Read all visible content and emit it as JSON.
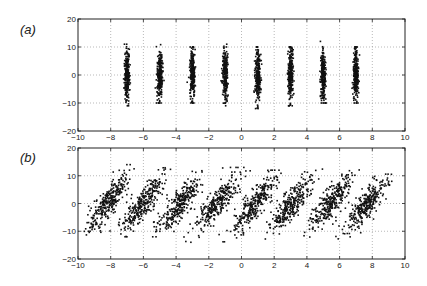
{
  "chart_data": [
    {
      "type": "scatter",
      "panel_label": "(a)",
      "title": "",
      "xlabel": "",
      "ylabel": "",
      "xlim": [
        -10,
        10
      ],
      "ylim": [
        -20,
        20
      ],
      "xticks": [
        -10,
        -8,
        -6,
        -4,
        -2,
        0,
        2,
        4,
        6,
        8,
        10
      ],
      "yticks": [
        -20,
        -10,
        0,
        10,
        20
      ],
      "grid": true,
      "legend": null,
      "clusters": [
        {
          "center_x": -7,
          "spread_x": 0.08,
          "shear": 0.0,
          "spread_y": 4.5,
          "y_range": [
            -11,
            11
          ]
        },
        {
          "center_x": -5,
          "spread_x": 0.08,
          "shear": 0.0,
          "spread_y": 4.5,
          "y_range": [
            -10,
            11
          ]
        },
        {
          "center_x": -3,
          "spread_x": 0.08,
          "shear": 0.0,
          "spread_y": 4.5,
          "y_range": [
            -10,
            10
          ]
        },
        {
          "center_x": -1,
          "spread_x": 0.08,
          "shear": 0.0,
          "spread_y": 4.5,
          "y_range": [
            -11,
            11
          ]
        },
        {
          "center_x": 1,
          "spread_x": 0.08,
          "shear": 0.0,
          "spread_y": 4.5,
          "y_range": [
            -12,
            10
          ]
        },
        {
          "center_x": 3,
          "spread_x": 0.08,
          "shear": 0.0,
          "spread_y": 4.5,
          "y_range": [
            -11,
            10
          ]
        },
        {
          "center_x": 5,
          "spread_x": 0.08,
          "shear": 0.0,
          "spread_y": 4.5,
          "y_range": [
            -10,
            12
          ]
        },
        {
          "center_x": 7,
          "spread_x": 0.08,
          "shear": 0.0,
          "spread_y": 4.5,
          "y_range": [
            -10,
            10
          ]
        }
      ],
      "points_per_cluster": 260
    },
    {
      "type": "scatter",
      "panel_label": "(b)",
      "title": "",
      "xlabel": "",
      "ylabel": "",
      "xlim": [
        -10,
        10
      ],
      "ylim": [
        -20,
        20
      ],
      "xticks": [
        -10,
        -8,
        -6,
        -4,
        -2,
        0,
        2,
        4,
        6,
        8,
        10
      ],
      "yticks": [
        -20,
        -10,
        0,
        10,
        20
      ],
      "grid": true,
      "legend": null,
      "clusters": [
        {
          "center_x": -8.2,
          "spread_x": 0.35,
          "shear": 0.11,
          "spread_y": 5.0,
          "y_range": [
            -13,
            14
          ]
        },
        {
          "center_x": -6.0,
          "spread_x": 0.35,
          "shear": 0.11,
          "spread_y": 5.0,
          "y_range": [
            -12,
            14
          ]
        },
        {
          "center_x": -3.8,
          "spread_x": 0.35,
          "shear": 0.11,
          "spread_y": 5.0,
          "y_range": [
            -12,
            15
          ]
        },
        {
          "center_x": -1.5,
          "spread_x": 0.35,
          "shear": 0.11,
          "spread_y": 5.0,
          "y_range": [
            -14,
            13
          ]
        },
        {
          "center_x": 0.8,
          "spread_x": 0.35,
          "shear": 0.11,
          "spread_y": 5.0,
          "y_range": [
            -14,
            12
          ]
        },
        {
          "center_x": 3.1,
          "spread_x": 0.35,
          "shear": 0.11,
          "spread_y": 5.0,
          "y_range": [
            -13,
            14
          ]
        },
        {
          "center_x": 5.4,
          "spread_x": 0.35,
          "shear": 0.11,
          "spread_y": 5.0,
          "y_range": [
            -13,
            13
          ]
        },
        {
          "center_x": 7.7,
          "spread_x": 0.35,
          "shear": 0.11,
          "spread_y": 5.0,
          "y_range": [
            -13,
            14
          ]
        }
      ],
      "points_per_cluster": 300
    }
  ],
  "colors": {
    "points": "#111111",
    "axes": "#222222",
    "grid": "#8a8a8a",
    "background": "#ffffff"
  }
}
